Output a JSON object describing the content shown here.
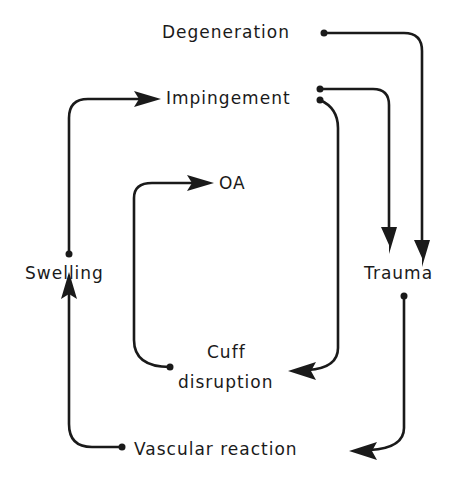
{
  "diagram": {
    "type": "flow-cycle",
    "nodes": [
      {
        "id": "degeneration",
        "label": "Degeneration"
      },
      {
        "id": "impingement",
        "label": "Impingement"
      },
      {
        "id": "oa",
        "label": "OA"
      },
      {
        "id": "swelling",
        "label": "Swelling"
      },
      {
        "id": "trauma",
        "label": "Trauma"
      },
      {
        "id": "cuff_disruption",
        "label_line1": "Cuff",
        "label_line2": "disruption"
      },
      {
        "id": "vascular_reaction",
        "label": "Vascular reaction"
      }
    ],
    "edges": [
      {
        "from": "degeneration",
        "to": "trauma"
      },
      {
        "from": "impingement",
        "to": "trauma"
      },
      {
        "from": "impingement",
        "to": "cuff_disruption"
      },
      {
        "from": "cuff_disruption",
        "to": "oa"
      },
      {
        "from": "trauma",
        "to": "vascular_reaction"
      },
      {
        "from": "vascular_reaction",
        "to": "swelling"
      },
      {
        "from": "swelling",
        "to": "impingement"
      }
    ],
    "colors": {
      "ink": "#1a1a1a",
      "background": "#ffffff"
    }
  }
}
